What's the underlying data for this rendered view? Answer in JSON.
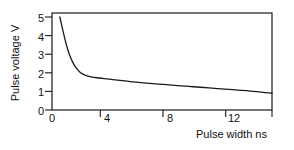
{
  "chart_data": {
    "type": "line",
    "title": "",
    "xlabel": "Pulse width ns",
    "ylabel": "Pulse voltage V",
    "xlim": [
      0,
      14
    ],
    "ylim": [
      0,
      5.3
    ],
    "grid": false,
    "legend": null,
    "xticks": [
      {
        "value": 0,
        "label": "0"
      },
      {
        "value": 4,
        "label": "4"
      },
      {
        "value": 8,
        "label": "8"
      },
      {
        "value": 12,
        "label": "12"
      }
    ],
    "yticks": [
      {
        "value": 0,
        "label": "0"
      },
      {
        "value": 1,
        "label": "1"
      },
      {
        "value": 2,
        "label": "2"
      },
      {
        "value": 3,
        "label": "3"
      },
      {
        "value": 4,
        "label": "4"
      },
      {
        "value": 5,
        "label": "5"
      }
    ],
    "series": [
      {
        "name": "pulse-voltage-vs-width",
        "x": [
          0.5,
          0.7,
          0.9,
          1.1,
          1.3,
          1.5,
          1.8,
          2.1,
          2.5,
          3.0,
          3.5,
          4.0,
          5.0,
          6.0,
          7.0,
          8.0,
          9.0,
          10.0,
          11.0,
          12.0,
          13.0,
          14.0
        ],
        "y": [
          5.0,
          4.25,
          3.55,
          3.0,
          2.6,
          2.3,
          2.02,
          1.88,
          1.78,
          1.72,
          1.67,
          1.62,
          1.53,
          1.45,
          1.38,
          1.31,
          1.25,
          1.19,
          1.12,
          1.06,
          0.99,
          0.9
        ]
      }
    ]
  },
  "axes": {
    "frame_color": "#1a1a1a",
    "curve_color": "#1a1a1a"
  }
}
